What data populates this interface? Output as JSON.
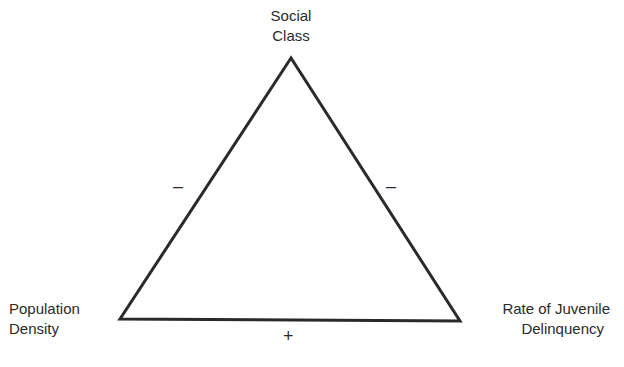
{
  "diagram": {
    "type": "triangle-relationship",
    "nodes": {
      "top": {
        "line1": "Social",
        "line2": "Class"
      },
      "left": {
        "line1": "Population",
        "line2": "Density"
      },
      "right": {
        "line1": "Rate of Juvenile",
        "line2": "Delinquency"
      }
    },
    "edges": {
      "top_left": {
        "from": "Social Class",
        "to": "Population Density",
        "sign": "–"
      },
      "top_right": {
        "from": "Social Class",
        "to": "Rate of Juvenile Delinquency",
        "sign": "–"
      },
      "bottom": {
        "from": "Population Density",
        "to": "Rate of Juvenile Delinquency",
        "sign": "+"
      }
    },
    "colors": {
      "line": "#2a2a2a",
      "background": "#ffffff"
    }
  }
}
